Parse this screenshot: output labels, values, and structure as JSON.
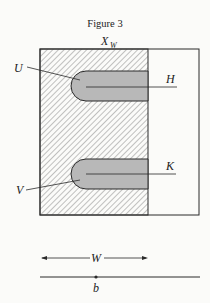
{
  "figure": {
    "title": "Figure 3",
    "labels": {
      "top": "X",
      "top_sub": "W",
      "upper_left": "U",
      "upper_right": "H",
      "lower_right": "K",
      "lower_left": "V",
      "width_arrow": "W",
      "base_point": "b"
    },
    "colors": {
      "line": "#2a2a2a",
      "hatch": "#555555",
      "slot_fill": "#b8b8b8",
      "background": "#fbfbf9"
    }
  }
}
